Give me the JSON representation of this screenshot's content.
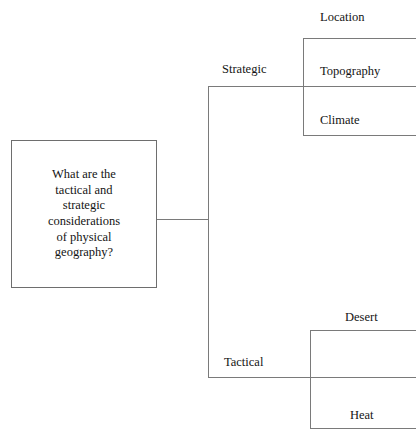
{
  "diagram": {
    "type": "tree-diagram",
    "orientation": "left-to-right",
    "background_color": "#ffffff",
    "line_color": "#7a7a7a",
    "text_color": "#141414",
    "root": {
      "label": "What are the\ntactical and\nstrategic\nconsiderations\nof physical\ngeography?",
      "shape": "rectangle"
    },
    "branches": [
      {
        "label": "Strategic",
        "children": [
          {
            "label": "Location"
          },
          {
            "label": "Topography"
          },
          {
            "label": "Climate"
          }
        ]
      },
      {
        "label": "Tactical",
        "children": [
          {
            "label": "Desert"
          },
          {
            "label": "Heat"
          }
        ]
      }
    ]
  }
}
